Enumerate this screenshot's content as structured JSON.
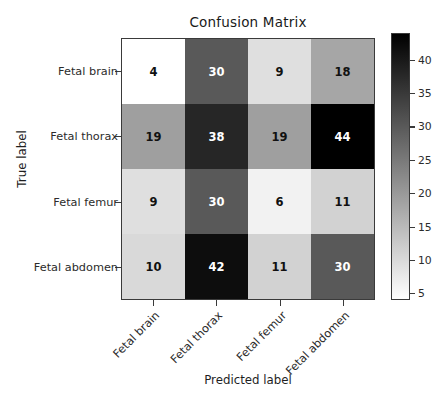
{
  "chart_data": {
    "type": "heatmap",
    "title": "Confusion Matrix",
    "xlabel": "Predicted label",
    "ylabel": "True label",
    "categories_x": [
      "Fetal brain",
      "Fetal thorax",
      "Fetal femur",
      "Fetal abdomen"
    ],
    "categories_y": [
      "Fetal brain",
      "Fetal thorax",
      "Fetal femur",
      "Fetal abdomen"
    ],
    "rows": [
      {
        "label": "Fetal brain",
        "values": [
          4,
          30,
          9,
          18
        ]
      },
      {
        "label": "Fetal thorax",
        "values": [
          19,
          38,
          19,
          44
        ]
      },
      {
        "label": "Fetal femur",
        "values": [
          9,
          30,
          6,
          11
        ]
      },
      {
        "label": "Fetal abdomen",
        "values": [
          10,
          42,
          11,
          30
        ]
      }
    ],
    "cells": [
      {
        "row": "Fetal brain",
        "col": "Fetal brain",
        "value": 4
      },
      {
        "row": "Fetal brain",
        "col": "Fetal thorax",
        "value": 30
      },
      {
        "row": "Fetal brain",
        "col": "Fetal femur",
        "value": 9
      },
      {
        "row": "Fetal brain",
        "col": "Fetal abdomen",
        "value": 18
      },
      {
        "row": "Fetal thorax",
        "col": "Fetal brain",
        "value": 19
      },
      {
        "row": "Fetal thorax",
        "col": "Fetal thorax",
        "value": 38
      },
      {
        "row": "Fetal thorax",
        "col": "Fetal femur",
        "value": 19
      },
      {
        "row": "Fetal thorax",
        "col": "Fetal abdomen",
        "value": 44
      },
      {
        "row": "Fetal femur",
        "col": "Fetal brain",
        "value": 9
      },
      {
        "row": "Fetal femur",
        "col": "Fetal thorax",
        "value": 30
      },
      {
        "row": "Fetal femur",
        "col": "Fetal femur",
        "value": 6
      },
      {
        "row": "Fetal femur",
        "col": "Fetal abdomen",
        "value": 11
      },
      {
        "row": "Fetal abdomen",
        "col": "Fetal brain",
        "value": 10
      },
      {
        "row": "Fetal abdomen",
        "col": "Fetal thorax",
        "value": 42
      },
      {
        "row": "Fetal abdomen",
        "col": "Fetal femur",
        "value": 11
      },
      {
        "row": "Fetal abdomen",
        "col": "Fetal abdomen",
        "value": 30
      }
    ],
    "colormap": "grey_reversed",
    "colorbar": {
      "ticks": [
        40,
        35,
        30,
        25,
        20,
        15,
        10,
        5
      ],
      "vmin": 4,
      "vmax": 44,
      "position": "right"
    },
    "grid": false,
    "colors": {
      "background": "#ffffff",
      "axis": "#3a3a3a",
      "text_dark": "#111111",
      "text_light": "#ffffff",
      "cmap_low": "#ffffff",
      "cmap_high": "#000000"
    }
  }
}
